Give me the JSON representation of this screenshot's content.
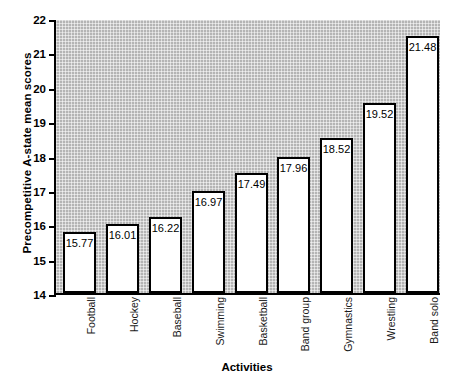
{
  "chart_data": {
    "type": "bar",
    "title": "",
    "xlabel": "Activities",
    "ylabel": "Precompetitive A-state mean scores",
    "categories": [
      "Football",
      "Hockey",
      "Baseball",
      "Swimming",
      "Basketball",
      "Band group",
      "Gymnastics",
      "Wrestling",
      "Band solo"
    ],
    "values": [
      15.77,
      16.01,
      16.22,
      16.97,
      17.49,
      17.96,
      18.52,
      19.52,
      21.48
    ],
    "value_labels": [
      "15.77",
      "16.01",
      "16.22",
      "16.97",
      "17.49",
      "17.96",
      "18.52",
      "19.52",
      "21.48"
    ],
    "ylim": [
      14,
      22
    ],
    "ytick_values": [
      14,
      15,
      16,
      17,
      18,
      19,
      20,
      21,
      22
    ],
    "ytick_labels": [
      "14",
      "15",
      "16",
      "17",
      "18",
      "19",
      "20",
      "21",
      "22"
    ],
    "grid": true,
    "legend": null,
    "colors": {
      "bar_fill": "#ffffff",
      "bar_outline": "#000000",
      "plot_background": "#b4b4b4",
      "axis": "#000000",
      "text": "#000000"
    }
  }
}
